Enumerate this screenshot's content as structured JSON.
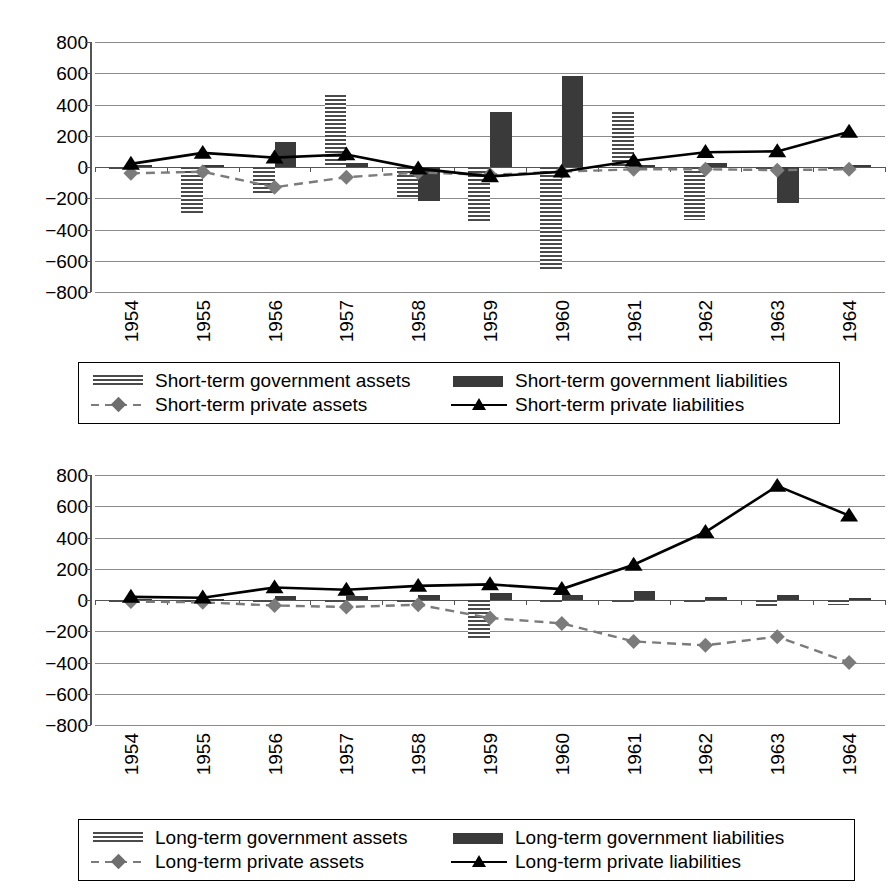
{
  "chart_data": [
    {
      "type": "bar",
      "id": "short-term",
      "title": "",
      "xlabel": "",
      "ylabel": "",
      "ylim": [
        -800,
        800
      ],
      "yticks": [
        800,
        600,
        400,
        200,
        0,
        -200,
        -400,
        -600,
        -800
      ],
      "grid": true,
      "legend_position": "bottom",
      "categories": [
        "1954",
        "1955",
        "1956",
        "1957",
        "1958",
        "1959",
        "1960",
        "1961",
        "1962",
        "1963",
        "1964"
      ],
      "series": [
        {
          "name": "Short-term government assets",
          "kind": "bar",
          "style": "hatched",
          "color": "#4a4a4a",
          "values": [
            -20,
            -310,
            -165,
            460,
            -195,
            -355,
            -660,
            350,
            -340,
            -25,
            -10
          ]
        },
        {
          "name": "Short-term government liabilities",
          "kind": "bar",
          "style": "solid",
          "color": "#3a3a3a",
          "values": [
            10,
            15,
            160,
            25,
            -215,
            355,
            580,
            10,
            25,
            -230,
            10
          ]
        },
        {
          "name": "Short-term private assets",
          "kind": "line",
          "style": "dashed",
          "marker": "diamond",
          "color": "#7b7b7b",
          "values": [
            -40,
            -30,
            -130,
            -65,
            -35,
            -50,
            -30,
            -15,
            -15,
            -20,
            -15
          ]
        },
        {
          "name": "Short-term private liabilities",
          "kind": "line",
          "style": "solid",
          "marker": "triangle",
          "color": "#000000",
          "values": [
            20,
            90,
            60,
            80,
            -10,
            -60,
            -30,
            40,
            95,
            100,
            225
          ]
        }
      ]
    },
    {
      "type": "bar",
      "id": "long-term",
      "title": "",
      "xlabel": "",
      "ylabel": "",
      "ylim": [
        -800,
        800
      ],
      "yticks": [
        800,
        600,
        400,
        200,
        0,
        -200,
        -400,
        -600,
        -800
      ],
      "grid": true,
      "legend_position": "bottom",
      "categories": [
        "1954",
        "1955",
        "1956",
        "1957",
        "1958",
        "1959",
        "1960",
        "1961",
        "1962",
        "1963",
        "1964"
      ],
      "series": [
        {
          "name": "Long-term government assets",
          "kind": "bar",
          "style": "hatched",
          "color": "#4a4a4a",
          "values": [
            -5,
            -8,
            -20,
            -15,
            -15,
            -250,
            -18,
            -20,
            -12,
            -40,
            -35
          ]
        },
        {
          "name": "Long-term government liabilities",
          "kind": "bar",
          "style": "solid",
          "color": "#3a3a3a",
          "values": [
            8,
            5,
            25,
            25,
            30,
            45,
            35,
            55,
            20,
            30,
            12
          ]
        },
        {
          "name": "Long-term private assets",
          "kind": "line",
          "style": "dashed",
          "marker": "diamond",
          "color": "#7b7b7b",
          "values": [
            -10,
            -15,
            -35,
            -45,
            -30,
            -115,
            -150,
            -265,
            -290,
            -235,
            -400
          ]
        },
        {
          "name": "Long-term private liabilities",
          "kind": "line",
          "style": "solid",
          "marker": "triangle",
          "color": "#000000",
          "values": [
            20,
            15,
            80,
            65,
            90,
            100,
            70,
            225,
            435,
            730,
            540
          ]
        }
      ]
    }
  ],
  "charts": [
    {
      "name": "short-term-chart",
      "yticks": [
        "800",
        "600",
        "400",
        "200",
        "0",
        "-200",
        "-400",
        "-600",
        "-800"
      ],
      "xticks": [
        "1954",
        "1955",
        "1956",
        "1957",
        "1958",
        "1959",
        "1960",
        "1961",
        "1962",
        "1963",
        "1964"
      ],
      "legend": [
        {
          "label": "Short-term government assets",
          "key": "hatched-bar-swatch"
        },
        {
          "label": "Short-term government liabilities",
          "key": "solid-bar-swatch"
        },
        {
          "label": "Short-term private assets",
          "key": "dashed-diamond-line-swatch"
        },
        {
          "label": "Short-term private liabilities",
          "key": "solid-triangle-line-swatch"
        }
      ]
    },
    {
      "name": "long-term-chart",
      "yticks": [
        "800",
        "600",
        "400",
        "200",
        "0",
        "-200",
        "-400",
        "-600",
        "-800"
      ],
      "xticks": [
        "1954",
        "1955",
        "1956",
        "1957",
        "1958",
        "1959",
        "1960",
        "1961",
        "1962",
        "1963",
        "1964"
      ],
      "legend": [
        {
          "label": "Long-term government assets",
          "key": "hatched-bar-swatch"
        },
        {
          "label": "Long-term government liabilities",
          "key": "solid-bar-swatch"
        },
        {
          "label": "Long-term private assets",
          "key": "dashed-diamond-line-swatch"
        },
        {
          "label": "Long-term private liabilities",
          "key": "solid-triangle-line-swatch"
        }
      ]
    }
  ],
  "colors": {
    "gov_assets": "#4a4a4a",
    "gov_liabilities": "#3a3a3a",
    "private_assets": "#7b7b7b",
    "private_liabilities": "#000000",
    "gridline": "#8a8a8a",
    "axis": "#555555"
  }
}
